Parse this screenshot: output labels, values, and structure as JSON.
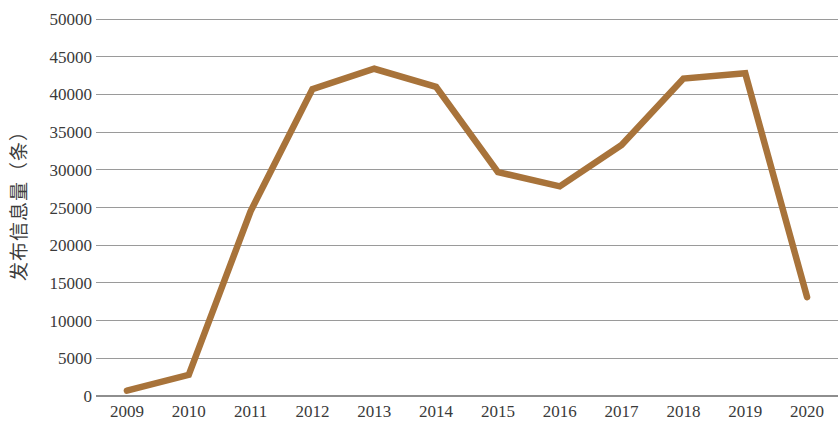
{
  "chart_data": {
    "type": "line",
    "title": "",
    "xlabel": "",
    "ylabel": "发布信息量（条）",
    "categories": [
      "2009",
      "2010",
      "2011",
      "2012",
      "2013",
      "2014",
      "2015",
      "2016",
      "2017",
      "2018",
      "2019",
      "2020"
    ],
    "series": [
      {
        "name": "发布信息量（条）",
        "color": "#A8733A",
        "values": [
          700,
          2800,
          24500,
          40700,
          43400,
          41000,
          29700,
          27800,
          33300,
          42100,
          42800,
          13100
        ]
      }
    ],
    "ylim": [
      0,
      50000
    ],
    "yticks": [
      0,
      5000,
      10000,
      15000,
      20000,
      25000,
      30000,
      35000,
      40000,
      45000,
      50000
    ],
    "ytick_labels": [
      "0",
      "5000",
      "10000",
      "15000",
      "20000",
      "25000",
      "30000",
      "35000",
      "40000",
      "45000",
      "50000"
    ],
    "grid": true,
    "grid_axis": "y",
    "legend": false,
    "legend_position": "none",
    "markers": false,
    "background": "#ffffff",
    "gridline_color": "#9a9a9a",
    "axis_color": "#8e8e8e",
    "text_color": "#3a3a3a"
  }
}
